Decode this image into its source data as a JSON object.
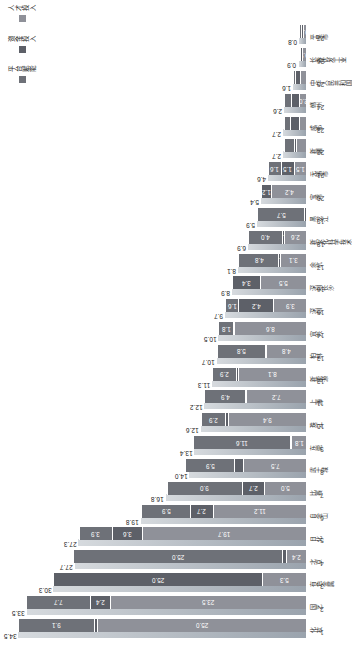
{
  "chart_data": {
    "type": "bar",
    "title": "",
    "xlabel": "",
    "ylabel": "",
    "orientation": "horizontal-stacked",
    "grid": false,
    "legend_position": "right",
    "xlim": [
      0,
      35
    ],
    "categories": [
      "化妆",
      "园艺",
      "有色金属",
      "北京",
      "日化",
      "自金山",
      "比赛",
      "武士城",
      "东莞",
      "珠江",
      "上海",
      "新能源",
      "柏林",
      "宜兴",
      "深圳",
      "深圳长沙",
      "余杭",
      "新安化科学技术",
      "黑龙江",
      "宝鸡",
      "无锡市",
      "新疆",
      "成都",
      "赣州",
      "中华人民共和国",
      "长春优发工业",
      "平果市"
    ],
    "ranks": [
      1,
      2,
      3,
      4,
      5,
      6,
      7,
      8,
      9,
      10,
      11,
      12,
      13,
      14,
      15,
      16,
      17,
      18,
      19,
      20,
      21,
      22,
      23,
      24,
      25,
      26,
      27
    ],
    "totals": [
      34.5,
      33.5,
      30.3,
      27.7,
      27.3,
      19.8,
      16.8,
      14.0,
      13.4,
      12.6,
      12.2,
      11.3,
      10.7,
      10.5,
      9.7,
      8.9,
      8.1,
      6.9,
      5.9,
      5.4,
      4.6,
      2.7,
      2.7,
      2.6,
      1.6,
      0.9,
      0.8
    ],
    "series": [
      {
        "name": "人才投入",
        "color": "#8f9199",
        "values": [
          25.0,
          23.5,
          5.3,
          2.4,
          19.7,
          11.2,
          5.0,
          7.5,
          1.8,
          9.4,
          7.2,
          8.1,
          4.8,
          8.6,
          3.9,
          5.5,
          3.1,
          2.6,
          0.0,
          4.2,
          1.5,
          1.2,
          0.9,
          0.8,
          0.7,
          0.5,
          0.4
        ]
      },
      {
        "name": "资金投入",
        "color": "#5d6068",
        "values": [
          0.4,
          2.4,
          25.0,
          0.5,
          3.6,
          2.7,
          2.7,
          1.1,
          0.1,
          0.3,
          0.1,
          0.3,
          0.1,
          0.1,
          4.2,
          3.4,
          0.2,
          0.3,
          0.2,
          1.2,
          1.5,
          0.3,
          1.0,
          1.0,
          0.6,
          0.2,
          0.2
        ]
      },
      {
        "name": "平台赋能",
        "color": "#6e7178",
        "values": [
          9.1,
          7.7,
          0.0,
          25.0,
          3.9,
          5.9,
          9.0,
          5.9,
          11.6,
          2.9,
          4.9,
          2.9,
          5.8,
          1.8,
          1.6,
          0.0,
          4.8,
          4.0,
          5.7,
          0.0,
          1.6,
          1.2,
          0.8,
          0.8,
          0.3,
          0.2,
          0.2
        ]
      }
    ],
    "segment_labels": [
      [
        "25.0",
        "",
        "9.1"
      ],
      [
        "23.5",
        "2.4",
        "7.7"
      ],
      [
        "5.3",
        "25.0",
        ""
      ],
      [
        "2.4",
        "",
        "25.0"
      ],
      [
        "19.7",
        "3.6",
        "3.9"
      ],
      [
        "11.2",
        "2.7",
        "5.9"
      ],
      [
        "5.0",
        "2.7",
        "9.0"
      ],
      [
        "7.5",
        "",
        "5.9"
      ],
      [
        "1.8",
        "",
        "11.6"
      ],
      [
        "9.4",
        "",
        "2.9"
      ],
      [
        "7.2",
        "0.1",
        "4.9"
      ],
      [
        "8.1",
        "",
        "2.9"
      ],
      [
        "4.8",
        "",
        "5.8"
      ],
      [
        "8.6",
        "0.1",
        "1.8"
      ],
      [
        "3.9",
        "4.2",
        "1.6"
      ],
      [
        "5.5",
        "3.4",
        ""
      ],
      [
        "3.1",
        "0.2",
        "4.8"
      ],
      [
        "2.6",
        "0.2",
        "4.0"
      ],
      [
        "",
        "",
        "5.7"
      ],
      [
        "4.2",
        "1.2",
        ""
      ],
      [
        "1.5",
        "1.5",
        "1.6"
      ],
      [
        "",
        "",
        ""
      ],
      [
        "",
        "",
        ""
      ],
      [
        "2.0",
        "",
        ""
      ],
      [
        "",
        "",
        ""
      ],
      [
        "0.9",
        "",
        ""
      ],
      [
        "0.8",
        "",
        ""
      ]
    ]
  },
  "legend": {
    "items": [
      {
        "label": "平台赋能",
        "color": "#6e7178"
      },
      {
        "label": "资金投入",
        "color": "#5d6068"
      },
      {
        "label": "人才投入",
        "color": "#8f9199"
      }
    ]
  }
}
